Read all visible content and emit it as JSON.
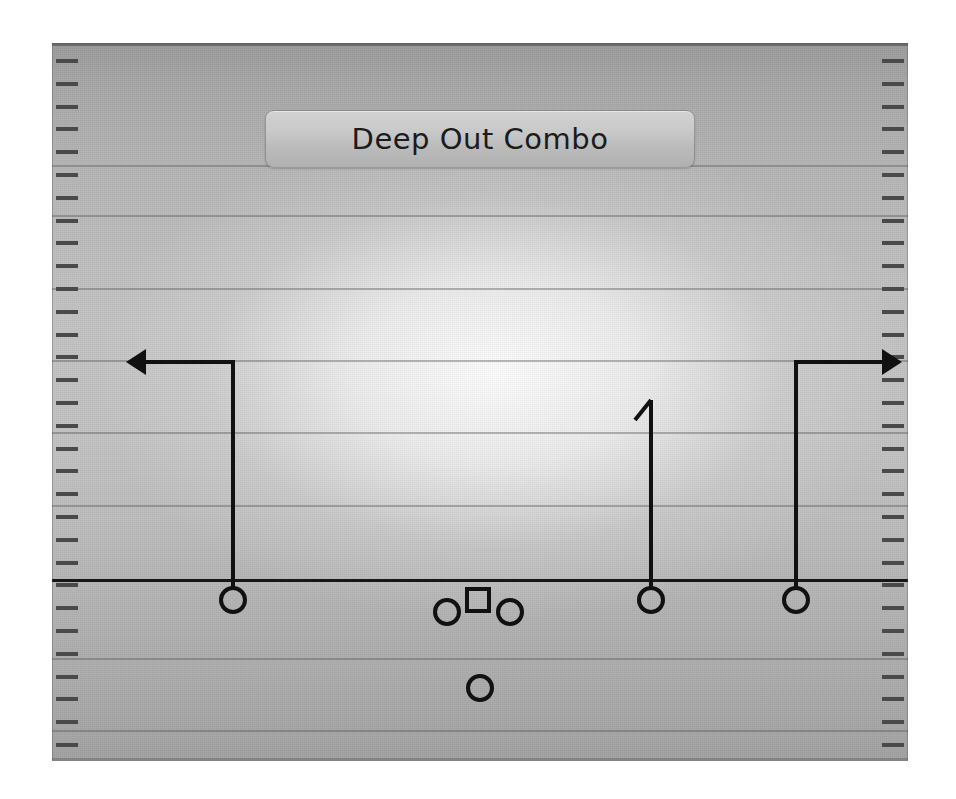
{
  "play": {
    "title": "Deep Out Combo",
    "field": {
      "surface_color": "#bdbdbd",
      "line_color": "#5a5a5a",
      "scrimmage_color": "#171717",
      "hash_color": "#4a4a4a",
      "hash_count_per_side": 31,
      "yard_line_count": 9
    },
    "ink_color": "#111111",
    "players": [
      {
        "id": "split-end-left",
        "symbol": "circle",
        "x": 233,
        "y": 600,
        "label": ""
      },
      {
        "id": "left-guard",
        "symbol": "circle",
        "x": 447,
        "y": 612,
        "label": ""
      },
      {
        "id": "center",
        "symbol": "square",
        "x": 478,
        "y": 600,
        "label": ""
      },
      {
        "id": "right-guard",
        "symbol": "circle",
        "x": 510,
        "y": 612,
        "label": ""
      },
      {
        "id": "running-back",
        "symbol": "circle",
        "x": 480,
        "y": 688,
        "label": ""
      },
      {
        "id": "slot-right",
        "symbol": "circle",
        "x": 651,
        "y": 600,
        "label": ""
      },
      {
        "id": "split-end-right",
        "symbol": "circle",
        "x": 796,
        "y": 600,
        "label": ""
      }
    ],
    "routes": [
      {
        "id": "route-left-out",
        "name": "deep out left",
        "start": {
          "x": 233,
          "y": 588
        },
        "break": {
          "x": 233,
          "y": 362
        },
        "end": {
          "x": 140,
          "y": 362
        },
        "end_marker": "arrow-left"
      },
      {
        "id": "route-middle-go",
        "name": "go middle",
        "start": {
          "x": 651,
          "y": 588
        },
        "break": {
          "x": 651,
          "y": 400
        },
        "end": {
          "x": 651,
          "y": 400
        },
        "end_marker": "flag-left"
      },
      {
        "id": "route-right-out",
        "name": "deep out right",
        "start": {
          "x": 796,
          "y": 588
        },
        "break": {
          "x": 796,
          "y": 362
        },
        "end": {
          "x": 888,
          "y": 362
        },
        "end_marker": "arrow-right"
      }
    ]
  }
}
